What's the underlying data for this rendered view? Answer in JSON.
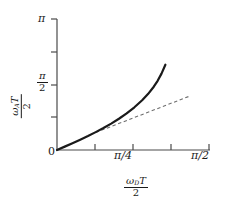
{
  "chart_data": {
    "type": "line",
    "title": "",
    "xlabel": "ω_D T / 2",
    "ylabel": "ω_A T / 2",
    "xlim": [
      0,
      1.5707963
    ],
    "ylim": [
      0,
      3.1415927
    ],
    "grid": false,
    "legend": null,
    "xticks": [
      {
        "value": 0,
        "label": "0"
      },
      {
        "value": 0.3926991,
        "label": ""
      },
      {
        "value": 0.7853982,
        "label": "π/4"
      },
      {
        "value": 1.1780972,
        "label": ""
      },
      {
        "value": 1.5707963,
        "label": "π/2"
      }
    ],
    "yticks": [
      {
        "value": 0,
        "label": "0"
      },
      {
        "value": 0.7853982,
        "label": ""
      },
      {
        "value": 1.5707963,
        "label": "π/2"
      },
      {
        "value": 2.3561945,
        "label": ""
      },
      {
        "value": 3.1415927,
        "label": "π"
      }
    ],
    "series": [
      {
        "name": "solid-curve",
        "style": "solid",
        "color": "#1a1a1a",
        "width": 2.2,
        "x": [
          0.0,
          0.08,
          0.16,
          0.24,
          0.32,
          0.4,
          0.48,
          0.56,
          0.64,
          0.72,
          0.8,
          0.88,
          0.94,
          1.0,
          1.04,
          1.08,
          1.12
        ],
        "y": [
          0.0,
          0.081,
          0.163,
          0.248,
          0.336,
          0.429,
          0.527,
          0.633,
          0.749,
          0.878,
          1.024,
          1.194,
          1.341,
          1.518,
          1.66,
          1.832,
          2.045
        ]
      },
      {
        "name": "dashed-asymptote",
        "style": "dashed",
        "color": "#6e6e6e",
        "width": 1.1,
        "x": [
          0.4,
          1.38
        ],
        "y": [
          0.42,
          1.3
        ]
      }
    ],
    "axis_labels": {
      "y_numerator_omega": "ω",
      "y_numerator_sub": "A",
      "y_numerator_T": "T",
      "y_denominator": "2",
      "x_numerator_omega": "ω",
      "x_numerator_sub": "D",
      "x_numerator_T": "T",
      "x_denominator": "2"
    },
    "tick_text": {
      "y_pi": "π",
      "y_pi_half_num": "π",
      "y_pi_half_den": "2",
      "origin": "0",
      "x_pi_over_4": "π/4",
      "x_pi_over_2": "π/2"
    },
    "colors": {
      "axis": "#4a4a4a",
      "curve": "#1a1a1a",
      "asymptote": "#6e6e6e",
      "background": "#ffffff"
    }
  }
}
